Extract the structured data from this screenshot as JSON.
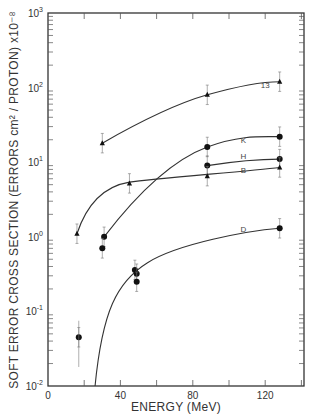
{
  "chart_data": {
    "type": "line",
    "title": "",
    "xlabel": "ENERGY (MeV)",
    "ylabel": "SOFT ERROR CROSS SECTION (ERRORS cm² / PROTON) x10⁻⁸",
    "xlim": [
      0,
      142
    ],
    "ylim": [
      0.01,
      1000
    ],
    "yscale": "log",
    "grid": false,
    "legend": "inline curve labels",
    "x_ticks": [
      0,
      40,
      80,
      120
    ],
    "x_tick_labels": [
      "0",
      "40",
      "80",
      "120"
    ],
    "y_ticks": [
      0.01,
      0.1,
      1,
      10,
      100,
      1000
    ],
    "y_tick_labels": [
      "10⁻²",
      "10⁻¹",
      "10⁰",
      "10¹",
      "10²",
      "10³"
    ],
    "series": [
      {
        "name": "13",
        "marker": "triangle",
        "x": [
          30,
          88,
          128
        ],
        "y": [
          18,
          80,
          120
        ]
      },
      {
        "name": "K",
        "marker": "circle",
        "x": [
          31,
          88,
          128
        ],
        "y": [
          1.0,
          16,
          22
        ]
      },
      {
        "name": "H",
        "marker": "circle",
        "x": [
          88,
          128
        ],
        "y": [
          9,
          11
        ]
      },
      {
        "name": "B",
        "marker": "triangle",
        "x": [
          16,
          45,
          88,
          128
        ],
        "y": [
          1.1,
          5.2,
          6.5,
          8.5
        ]
      },
      {
        "name": "D",
        "marker": "circle",
        "x": [
          17,
          30,
          48,
          49,
          49,
          128
        ],
        "y": [
          0.045,
          0.7,
          0.36,
          0.32,
          0.25,
          1.3
        ]
      }
    ],
    "curve_label_positions": {
      "13": [
        120,
        100
      ],
      "K": [
        108,
        18
      ],
      "H": [
        108,
        11
      ],
      "B": [
        108,
        7.2
      ],
      "D": [
        108,
        1.15
      ]
    }
  }
}
